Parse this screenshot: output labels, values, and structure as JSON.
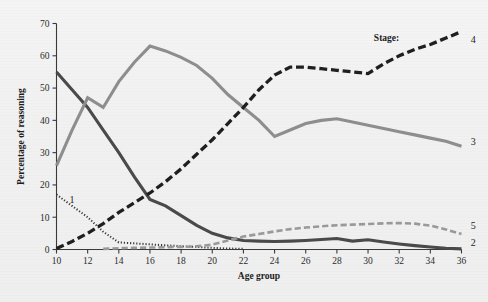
{
  "figure": {
    "background_color": "#f1f1f1",
    "legend_title": "Stage:",
    "x_axis": {
      "label": "Age group",
      "min": 10,
      "max": 36,
      "ticks": [
        10,
        12,
        14,
        16,
        18,
        20,
        22,
        24,
        26,
        28,
        30,
        32,
        34,
        36
      ],
      "tick_labels": [
        "10",
        "12",
        "14",
        "16",
        "18",
        "20",
        "22",
        "24",
        "26",
        "28",
        "30",
        "32",
        "34",
        "36"
      ]
    },
    "y_axis": {
      "label": "Percentage of reasoning",
      "min": 0,
      "max": 70,
      "ticks": [
        0,
        10,
        20,
        30,
        40,
        50,
        60,
        70
      ],
      "tick_labels": [
        "0",
        "10",
        "20",
        "30",
        "40",
        "50",
        "60",
        "70"
      ]
    }
  },
  "chart_data": {
    "type": "line",
    "title": "",
    "xlabel": "Age group",
    "ylabel": "Percentage of reasoning",
    "xlim": [
      10,
      36
    ],
    "ylim": [
      0,
      70
    ],
    "grid": false,
    "legend_position": "inline-right-end-labels",
    "legend_title": "Stage:",
    "x": [
      10,
      11,
      12,
      13,
      14,
      15,
      16,
      17,
      18,
      19,
      20,
      21,
      22,
      23,
      24,
      25,
      26,
      27,
      28,
      29,
      30,
      31,
      32,
      33,
      34,
      35,
      36
    ],
    "series": [
      {
        "name": "1",
        "label": "1",
        "color": "#3a3a3a",
        "style": "dotted",
        "width": 2.0,
        "label_x": 11.0,
        "label_y": 15.5,
        "values": [
          17,
          13.5,
          10,
          5.5,
          2.2,
          1.9,
          1.6,
          1.3,
          1.0,
          0.8,
          0.5,
          0.3,
          0.2,
          null,
          null,
          null,
          null,
          null,
          null,
          null,
          null,
          null,
          null,
          null,
          null,
          null,
          null
        ]
      },
      {
        "name": "2",
        "label": "2",
        "color": "#4a4a4a",
        "style": "solid",
        "width": 3.1,
        "label_x": 36.6,
        "label_y": 2.0,
        "values": [
          55,
          49.5,
          44,
          37,
          30,
          22.5,
          15.5,
          13.5,
          10.5,
          7.5,
          5.0,
          3.6,
          2.8,
          2.6,
          2.5,
          2.6,
          2.8,
          3.1,
          3.4,
          2.6,
          3.0,
          2.3,
          1.7,
          1.2,
          0.8,
          0.4,
          0.2
        ]
      },
      {
        "name": "3",
        "label": "3",
        "color": "#8e8e8e",
        "style": "solid",
        "width": 3.1,
        "label_x": 36.6,
        "label_y": 33.5,
        "values": [
          26,
          37,
          47,
          44,
          52,
          58,
          63,
          61.5,
          59.5,
          57,
          53,
          48,
          44,
          40,
          35,
          37,
          39,
          40,
          40.5,
          39.5,
          38.5,
          37.5,
          36.5,
          35.5,
          34.5,
          33.5,
          32
        ]
      },
      {
        "name": "4",
        "label": "4",
        "color": "#1f1f1f",
        "style": "dashed",
        "width": 3.3,
        "label_x": 36.6,
        "label_y": 65.0,
        "values": [
          0.3,
          2.5,
          5.0,
          8.0,
          11.5,
          14.5,
          17.5,
          21,
          25,
          29.5,
          34,
          39,
          44,
          49.5,
          54,
          56.5,
          56.5,
          56.0,
          55.5,
          55.0,
          54.5,
          57.5,
          60.0,
          62.0,
          63.5,
          65.5,
          67.5
        ]
      },
      {
        "name": "5",
        "label": "5",
        "color": "#9a9a9a",
        "style": "dashed",
        "width": 2.6,
        "label_x": 36.6,
        "label_y": 7.5,
        "values": [
          null,
          null,
          null,
          0.2,
          0.4,
          0.5,
          0.6,
          0.7,
          0.8,
          1.0,
          1.5,
          2.8,
          4.0,
          4.8,
          5.6,
          6.3,
          6.8,
          7.2,
          7.5,
          7.7,
          7.9,
          8.1,
          8.2,
          8.0,
          7.4,
          6.2,
          4.8
        ]
      }
    ]
  }
}
